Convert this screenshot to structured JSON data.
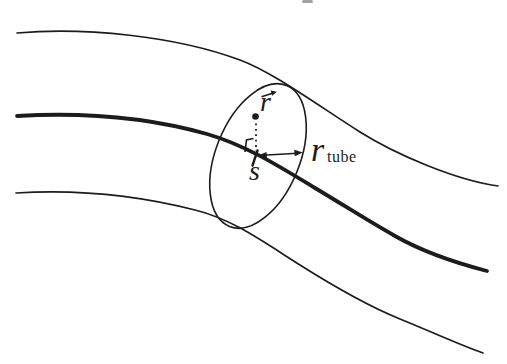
{
  "figure": {
    "background": "#ffffff",
    "ink": "#1c1c1c",
    "labels": {
      "point_vector": "r",
      "arc_position": "s",
      "tube_radius_base": "r",
      "tube_radius_subscript": "tube"
    },
    "icons": {
      "vector_arrow": "right-arrow-over-r",
      "tube_radius_arrow": "double-headed-arrow",
      "perpendicular_mark": "right-angle-mark"
    }
  }
}
